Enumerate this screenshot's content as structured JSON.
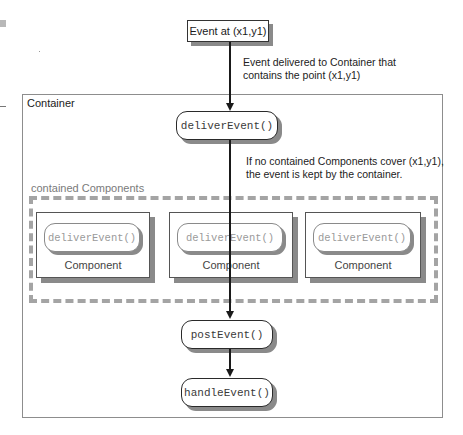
{
  "diagram": {
    "event_box": {
      "label": "Event at (x1,y1)"
    },
    "notes": {
      "delivered_line1": "Event delivered to Container that",
      "delivered_line2": "contains the point (x1,y1)",
      "kept_line1": "If no contained Components cover (x1,y1),",
      "kept_line2": "the event is kept by the container."
    },
    "container": {
      "label": "Container",
      "deliver_method": "deliverEvent()",
      "post_method": "postEvent()",
      "handle_method": "handleEvent()"
    },
    "contained_components": {
      "label": "contained Components",
      "items": [
        {
          "method": "deliverEvent()",
          "label": "Component"
        },
        {
          "method": "deliverEvent()",
          "label": "Component"
        },
        {
          "method": "deliverEvent()",
          "label": "Component"
        }
      ]
    },
    "colors": {
      "line": "#1a1a1a",
      "shadow": "#8a8a8a",
      "dashed_border": "#a4a4a4",
      "container_border": "#8d8d8d"
    }
  }
}
